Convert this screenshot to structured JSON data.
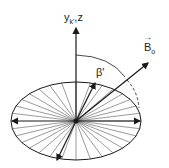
{
  "diagram": {
    "axis_label": {
      "main": "y",
      "sub": "k'",
      "sep": ",",
      "z": "z"
    },
    "angle_label": "β'",
    "field_label": {
      "arrow": "→",
      "main": "B",
      "sub": "o"
    },
    "colors": {
      "stroke": "#1a1a1a",
      "spoke": "#555555"
    }
  }
}
